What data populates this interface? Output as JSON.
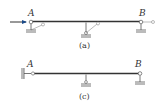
{
  "diagram_a": {
    "caption": "(a)",
    "label_left": "A",
    "label_right": "B",
    "has_axial_arrow": true,
    "supports": [
      "pin-with-link",
      "pin-with-link",
      "pin-with-link"
    ]
  },
  "diagram_c": {
    "caption": "(c)",
    "label_left": "A",
    "label_right": "B",
    "supports": [
      "sliding-clamp",
      "pin",
      "pin"
    ]
  },
  "colors": {
    "beam": "#333333",
    "support": "#555555",
    "hatch": "#999999",
    "arrow": "#1a4a8a"
  }
}
